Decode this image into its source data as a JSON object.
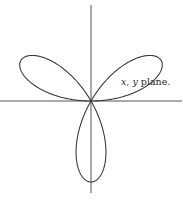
{
  "figure": {
    "label": {
      "var_x": "x",
      "separator": ", ",
      "var_y": "y",
      "text": " plane."
    },
    "curve": {
      "type": "three-leaved rose",
      "equation": "r = a sin 3θ",
      "leaves": 3,
      "stroke_color": "#3a3a3a"
    },
    "axes": {
      "color": "#555555",
      "horizontal": true,
      "vertical": true
    }
  }
}
